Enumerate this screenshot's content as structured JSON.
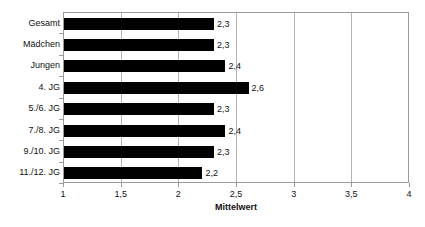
{
  "chart_data": {
    "type": "bar",
    "orientation": "horizontal",
    "title": "",
    "xlabel": "Mittelwert",
    "ylabel": "",
    "xlim": [
      1,
      4
    ],
    "grid": true,
    "legend": false,
    "decimal_separator": ",",
    "categories": [
      "Gesamt",
      "Mädchen",
      "Jungen",
      "4. JG",
      "5./6. JG",
      "7./8. JG",
      "9./10. JG",
      "11./12. JG"
    ],
    "values": [
      2.3,
      2.3,
      2.4,
      2.6,
      2.3,
      2.4,
      2.3,
      2.2
    ],
    "value_labels": [
      "2,3",
      "2,3",
      "2,4",
      "2,6",
      "2,3",
      "2,4",
      "2,3",
      "2,2"
    ],
    "xticks": [
      1,
      1.5,
      2,
      2.5,
      3,
      3.5,
      4
    ],
    "xtick_labels": [
      "1",
      "1,5",
      "2",
      "2,5",
      "3",
      "3,5",
      "4"
    ],
    "colors": {
      "bar": "#000000",
      "grid": "#b4b4b4",
      "axis": "#9a9a9a",
      "background": "#ffffff",
      "text": "#111111"
    }
  }
}
